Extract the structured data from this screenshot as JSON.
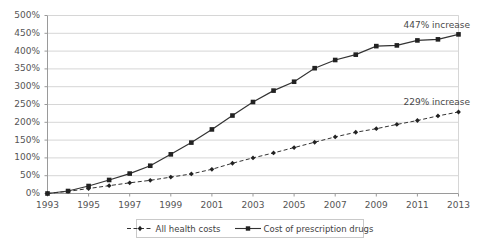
{
  "chart_data": {
    "type": "line",
    "title": "",
    "subtitle": "",
    "xlabel": "",
    "ylabel": "",
    "x": [
      1993,
      1994,
      1995,
      1996,
      1997,
      1998,
      1999,
      2000,
      2001,
      2002,
      2003,
      2004,
      2005,
      2006,
      2007,
      2008,
      2009,
      2010,
      2011,
      2012,
      2013
    ],
    "xtick_labels": [
      "1993",
      "1995",
      "1997",
      "1999",
      "2001",
      "2003",
      "2005",
      "2007",
      "2009",
      "2011",
      "2013"
    ],
    "xtick_values": [
      1993,
      1995,
      1997,
      1999,
      2001,
      2003,
      2005,
      2007,
      2009,
      2011,
      2013
    ],
    "xlim": [
      1993,
      2013
    ],
    "ytick_labels": [
      "0%",
      "50%",
      "100%",
      "150%",
      "200%",
      "250%",
      "300%",
      "350%",
      "400%",
      "450%",
      "500%"
    ],
    "ytick_values": [
      0,
      50,
      100,
      150,
      200,
      250,
      300,
      350,
      400,
      450,
      500
    ],
    "ylim": [
      0,
      500
    ],
    "grid": "horizontal",
    "legend_position": "bottom",
    "series": [
      {
        "name": "All health costs",
        "style": "dashed",
        "marker": "diamond",
        "color": "#333333",
        "values": [
          0,
          6,
          14,
          22,
          30,
          37,
          46,
          55,
          68,
          85,
          100,
          114,
          129,
          144,
          159,
          172,
          182,
          194,
          205,
          218,
          229
        ]
      },
      {
        "name": "Cost of prescription drugs",
        "style": "solid",
        "marker": "square",
        "color": "#333333",
        "values": [
          0,
          7,
          21,
          38,
          56,
          78,
          110,
          143,
          180,
          219,
          257,
          289,
          314,
          352,
          375,
          390,
          414,
          416,
          430,
          433,
          447
        ]
      }
    ],
    "annotations": [
      {
        "text": "447% increase",
        "series": "Cost of prescription drugs",
        "x": 2013,
        "y": 447
      },
      {
        "text": "229% increase",
        "series": "All health costs",
        "x": 2013,
        "y": 229
      }
    ]
  },
  "legend": {
    "items": [
      {
        "label": "All health costs"
      },
      {
        "label": "Cost of prescription drugs"
      }
    ]
  },
  "annotations": {
    "drugs_increase": "447% increase",
    "health_increase": "229% increase"
  },
  "colors": {
    "line": "#333333",
    "grid": "#d6d6d6",
    "axis": "#9a9a9a",
    "tick_text": "#555555",
    "background": "#ffffff"
  }
}
